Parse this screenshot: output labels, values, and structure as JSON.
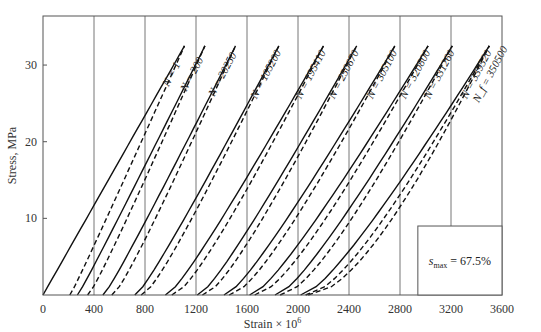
{
  "chart_data": {
    "type": "line",
    "title": "",
    "xlabel": "Strain × 10^6",
    "xlabel_base": "Strain × 10",
    "xlabel_exp": "6",
    "ylabel": "Stress, MPa",
    "xlim": [
      0,
      3600
    ],
    "ylim": [
      0,
      36.4
    ],
    "x_ticks": [
      0,
      400,
      800,
      1200,
      1600,
      2000,
      2400,
      2800,
      3200,
      3600
    ],
    "y_ticks": [
      10,
      20,
      30
    ],
    "grid": "vertical lines at 400-strain intervals",
    "legend": "solid = loading, dashed = unloading/reloading per cycle",
    "annotation": {
      "symbol": "s",
      "subscript": "max",
      "text": "= 67.5%",
      "value": 67.5
    },
    "peak_stress_mpa": 32.5,
    "series": [
      {
        "label": "N = 1",
        "cycle": 1,
        "solid": {
          "start": 0,
          "peak": 1110
        },
        "dashed": {
          "start": 210,
          "peak": 1110
        },
        "curvature": 0.0
      },
      {
        "label": "N = 200",
        "cycle": 200,
        "solid": {
          "start": 270,
          "peak": 1270
        },
        "dashed": {
          "start": 350,
          "peak": 1270
        },
        "curvature": 0.05
      },
      {
        "label": "N = 20250",
        "cycle": 20250,
        "solid": {
          "start": 470,
          "peak": 1510
        },
        "dashed": {
          "start": 540,
          "peak": 1510
        },
        "curvature": 0.1
      },
      {
        "label": "N = 105200",
        "cycle": 105200,
        "solid": {
          "start": 720,
          "peak": 1850
        },
        "dashed": {
          "start": 770,
          "peak": 1850
        },
        "curvature": 0.15
      },
      {
        "label": "N = 195410",
        "cycle": 195410,
        "solid": {
          "start": 960,
          "peak": 2200
        },
        "dashed": {
          "start": 1010,
          "peak": 2200
        },
        "curvature": 0.2
      },
      {
        "label": "N = 250670",
        "cycle": 250670,
        "solid": {
          "start": 1210,
          "peak": 2460
        },
        "dashed": {
          "start": 1250,
          "peak": 2460
        },
        "curvature": 0.22
      },
      {
        "label": "N = 305100",
        "cycle": 305100,
        "solid": {
          "start": 1420,
          "peak": 2760
        },
        "dashed": {
          "start": 1460,
          "peak": 2760
        },
        "curvature": 0.25
      },
      {
        "label": "N = 320800",
        "cycle": 320800,
        "solid": {
          "start": 1620,
          "peak": 3020
        },
        "dashed": {
          "start": 1660,
          "peak": 3020
        },
        "curvature": 0.28
      },
      {
        "label": "N = 331260",
        "cycle": 331260,
        "solid": {
          "start": 1820,
          "peak": 3210
        },
        "dashed": {
          "start": 1860,
          "peak": 3210
        },
        "curvature": 0.3
      },
      {
        "label": "N = 339520",
        "cycle": 339520,
        "solid": {
          "start": 2020,
          "peak": 3500
        },
        "dashed": {
          "start": 2060,
          "peak": 3500
        },
        "curvature": 0.33
      },
      {
        "label": "N_f = 350500",
        "cycle": 350500,
        "solid": null,
        "dashed": {
          "start": 2080,
          "peak": 3500
        },
        "curvature": 0.45
      }
    ],
    "inset_box": {
      "x_from": 2940,
      "x_to": 3600,
      "y_from": 0,
      "y_to": 9.0
    }
  },
  "colors": {
    "axis": "#555555",
    "grid": "#666666",
    "curve": "#111111",
    "text": "#333333",
    "background": "#ffffff"
  }
}
